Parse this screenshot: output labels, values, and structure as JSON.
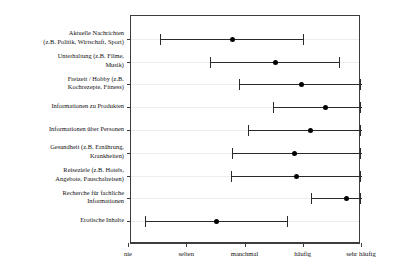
{
  "chart_data": {
    "type": "scatter",
    "title": "",
    "subtitle": "",
    "xlabel": "",
    "ylabel": "",
    "grid": true,
    "legend": null,
    "orientation": "horizontal",
    "x_tick_labels": [
      "nie",
      "selten",
      "manchmal",
      "häufig",
      "sehr häufig"
    ],
    "x_tick_values": [
      1,
      2,
      3,
      4,
      5
    ],
    "xlim": [
      0.95,
      5.0
    ],
    "categories": [
      "Aktuelle Nachrichten (z.B. Politik, Wirtschaft, Sport)",
      "Unterhaltung (z.B. Filme, Musik)",
      "Freizeit / Hobby (z.B. Kochrezepte, Fitness)",
      "Informationen zu Produkten",
      "Informationen über Personen",
      "Gesundheit (z.B. Ernährung, Krankheiten)",
      "Reiseziele (z.B. Hotels, Angebote, Pauschalreisen)",
      "Recherche für fachliche Informationen",
      "Erotische Inhalte"
    ],
    "category_label_lines": [
      [
        "Aktuelle Nachrichten",
        "(z.B. Politik, Wirtschaft, Sport)"
      ],
      [
        "Unterhaltung (z.B. Filme,",
        "Musik)"
      ],
      [
        "Freizeit / Hobby (z.B.",
        "Kochrezepte, Fitness)"
      ],
      [
        "Informationen zu Produkten"
      ],
      [
        "Informationen über Personen"
      ],
      [
        "Gesundheit (z.B. Ernährung,",
        "Krankheiten)"
      ],
      [
        "Reiseziele (z.B. Hotels,",
        "Angebote, Pauschalreisen)"
      ],
      [
        "Recherche für fachliche",
        "Informationen"
      ],
      [
        "Erotische Inhalte"
      ]
    ],
    "series": [
      {
        "name": "Mittelwert",
        "values": [
          2.77,
          3.51,
          3.95,
          4.37,
          4.11,
          3.83,
          3.87,
          4.73,
          2.5
        ]
      },
      {
        "name": "Untergrenze",
        "values": [
          1.53,
          2.39,
          2.88,
          3.48,
          3.05,
          2.76,
          2.75,
          4.12,
          1.28
        ]
      },
      {
        "name": "Obergrenze",
        "values": [
          3.98,
          4.61,
          5.0,
          5.0,
          5.0,
          4.89,
          5.0,
          5.0,
          3.71
        ]
      }
    ],
    "points": [
      {
        "category": "Aktuelle Nachrichten (z.B. Politik, Wirtschaft, Sport)",
        "low": 1.53,
        "mean": 2.77,
        "high": 3.98
      },
      {
        "category": "Unterhaltung (z.B. Filme, Musik)",
        "low": 2.39,
        "mean": 3.51,
        "high": 4.61
      },
      {
        "category": "Freizeit / Hobby (z.B. Kochrezepte, Fitness)",
        "low": 2.88,
        "mean": 3.95,
        "high": 5.0
      },
      {
        "category": "Informationen zu Produkten",
        "low": 3.48,
        "mean": 4.37,
        "high": 5.0
      },
      {
        "category": "Informationen über Personen",
        "low": 3.05,
        "mean": 4.11,
        "high": 5.0
      },
      {
        "category": "Gesundheit (z.B. Ernährung, Krankheiten)",
        "low": 2.76,
        "mean": 3.83,
        "high": 5.0
      },
      {
        "category": "Reiseziele (z.B. Hotels, Angebote, Pauschalreisen)",
        "low": 2.75,
        "mean": 3.87,
        "high": 5.0
      },
      {
        "category": "Recherche für fachliche Informationen",
        "low": 4.12,
        "mean": 4.73,
        "high": 5.0
      },
      {
        "category": "Erotische Inhalte",
        "low": 1.28,
        "mean": 2.5,
        "high": 3.71
      }
    ],
    "colors": {
      "marker": "#000000",
      "range_line": "#2b2b2b",
      "frame": "#3d3d3d",
      "grid": "#ededed",
      "background": "#ffffff",
      "text": "#111111"
    }
  }
}
